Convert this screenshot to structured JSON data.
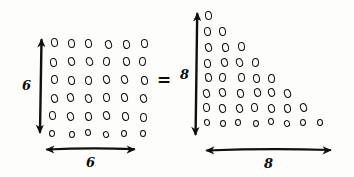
{
  "diagram": {
    "ink_color": "#101010",
    "background_color": "#fdfdfb",
    "equals_symbol": "=",
    "left_figure": {
      "name": "square-dot-array",
      "shape": "square",
      "rows": 6,
      "columns": 6,
      "total_dots": 36,
      "vertical_label": "6",
      "horizontal_label": "6",
      "row_counts": [
        6,
        6,
        6,
        6,
        6,
        6
      ]
    },
    "right_figure": {
      "name": "triangular-dot-array",
      "shape": "triangle",
      "rows": 8,
      "columns": 8,
      "total_dots": 36,
      "vertical_label": "8",
      "horizontal_label": "8",
      "row_counts": [
        1,
        2,
        3,
        4,
        5,
        6,
        7,
        8
      ]
    }
  },
  "chart_data": {
    "type": "scatter",
    "xlabel": "",
    "ylabel": "",
    "series": [
      {
        "name": "square-dot-array",
        "rows": 6,
        "columns": 6,
        "row_counts": [
          6,
          6,
          6,
          6,
          6,
          6
        ],
        "total": 36,
        "axis_labels": {
          "vertical": "6",
          "horizontal": "6"
        }
      },
      {
        "name": "triangular-dot-array",
        "rows": 8,
        "columns": 8,
        "row_counts": [
          1,
          2,
          3,
          4,
          5,
          6,
          7,
          8
        ],
        "total": 36,
        "axis_labels": {
          "vertical": "8",
          "horizontal": "8"
        }
      }
    ],
    "relation": "="
  }
}
